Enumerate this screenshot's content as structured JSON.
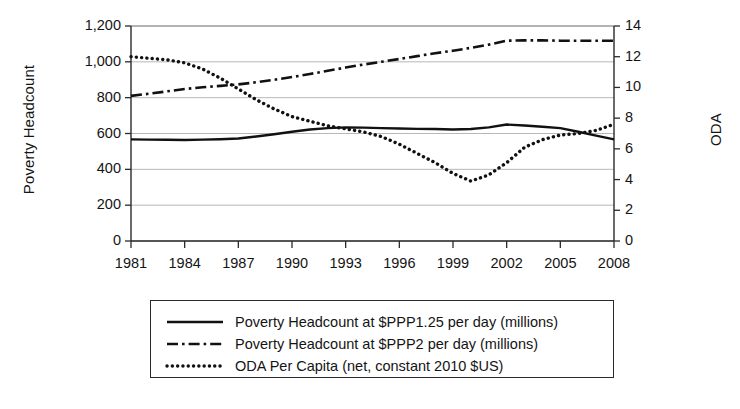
{
  "chart_data": {
    "type": "line",
    "title": "",
    "xlabel": "",
    "ylabel": "Poverty Headcount",
    "y2label": "ODA",
    "x": [
      1981,
      1982,
      1983,
      1984,
      1985,
      1986,
      1987,
      1988,
      1989,
      1990,
      1991,
      1992,
      1993,
      1994,
      1995,
      1996,
      1997,
      1998,
      1999,
      2000,
      2001,
      2002,
      2003,
      2004,
      2005,
      2006,
      2007,
      2008
    ],
    "xtick_labels": [
      "1981",
      "1984",
      "1987",
      "1990",
      "1993",
      "1996",
      "1999",
      "2002",
      "2005",
      "2008"
    ],
    "xticks": [
      1981,
      1984,
      1987,
      1990,
      1993,
      1996,
      1999,
      2002,
      2005,
      2008
    ],
    "xlim": [
      1981,
      2008
    ],
    "ylim": [
      0,
      1200
    ],
    "yticks": [
      0,
      200,
      400,
      600,
      800,
      1000,
      1200
    ],
    "ytick_labels": [
      "0",
      "200",
      "400",
      "600",
      "800",
      "1,000",
      "1,200"
    ],
    "y2lim": [
      0,
      14
    ],
    "y2ticks": [
      0,
      2,
      4,
      6,
      8,
      10,
      12,
      14
    ],
    "y2tick_labels": [
      "0",
      "2",
      "4",
      "6",
      "8",
      "10",
      "12",
      "14"
    ],
    "grid": true,
    "legend_position": "below",
    "series": [
      {
        "name": "Poverty Headcount at $PPP1.25 per day (millions)",
        "axis": "left",
        "style": "solid",
        "color": "#111111",
        "values": [
          567,
          566,
          565,
          564,
          566,
          568,
          572,
          583,
          596,
          610,
          622,
          630,
          634,
          633,
          630,
          628,
          626,
          625,
          622,
          625,
          634,
          650,
          645,
          638,
          630,
          610,
          588,
          567
        ]
      },
      {
        "name": "Poverty Headcount at $PPP2 per day (millions)",
        "axis": "left",
        "style": "dash-dot",
        "color": "#111111",
        "values": [
          810,
          822,
          835,
          848,
          858,
          866,
          874,
          886,
          900,
          915,
          932,
          950,
          968,
          985,
          1000,
          1016,
          1032,
          1048,
          1062,
          1078,
          1096,
          1118,
          1120,
          1120,
          1118,
          1118,
          1118,
          1118
        ]
      },
      {
        "name": "ODA Per Capita (net, constant 2010 $US)",
        "axis": "right",
        "style": "dotted",
        "color": "#111111",
        "values": [
          12.0,
          11.9,
          11.8,
          11.6,
          11.2,
          10.6,
          9.9,
          9.2,
          8.6,
          8.1,
          7.8,
          7.5,
          7.3,
          7.1,
          6.8,
          6.3,
          5.7,
          5.1,
          4.4,
          3.9,
          4.3,
          5.1,
          6.1,
          6.6,
          6.9,
          7.0,
          7.2,
          7.6
        ]
      }
    ]
  },
  "legend": {
    "items": [
      {
        "label": "Poverty Headcount at $PPP1.25 per day (millions)",
        "style": "solid"
      },
      {
        "label": "Poverty Headcount at $PPP2 per day (millions)",
        "style": "dash-dot"
      },
      {
        "label": "ODA Per Capita (net, constant 2010 $US)",
        "style": "dotted"
      }
    ]
  }
}
